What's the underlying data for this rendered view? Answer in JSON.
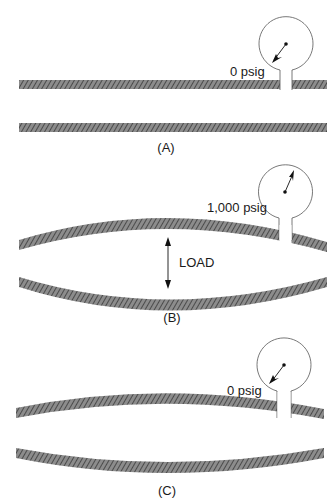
{
  "panels": [
    {
      "id": "A",
      "caption": "(A)",
      "gauge_label": "0 psig",
      "state": "flat pipe, gauge reads zero"
    },
    {
      "id": "B",
      "caption": "(B)",
      "gauge_label": "1,000 psig",
      "load_label": "LOAD",
      "state": "pipe bulged under pressure"
    },
    {
      "id": "C",
      "caption": "(C)",
      "gauge_label": "0 psig",
      "state": "pipe remains deformed after pressure released"
    }
  ],
  "colors": {
    "hatch_fill": "#7a7a7a",
    "hatch_line": "#3a3a3a",
    "outline": "#555555"
  }
}
